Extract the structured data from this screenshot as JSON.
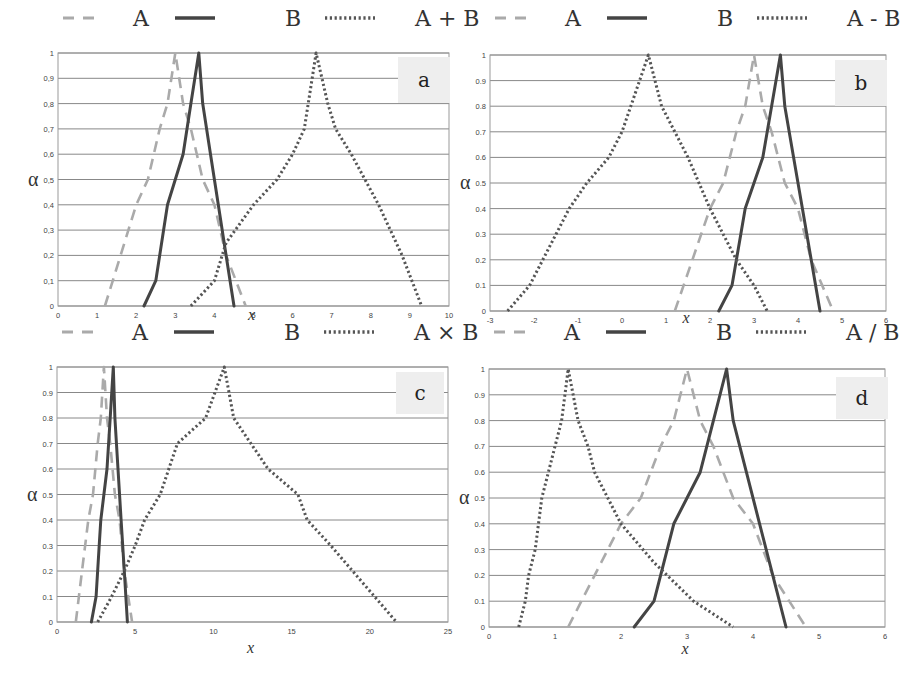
{
  "figure": {
    "legend_symbols": {
      "A": "dashed-grey",
      "B": "solid-dark",
      "op": "dotted-dark"
    }
  },
  "colors": {
    "A": "#aaaaaa",
    "B": "#444444",
    "op": "#555555",
    "grid": "#888888",
    "label_box": "#eeeeee"
  },
  "chart_data": [
    {
      "type": "line",
      "panel": "a",
      "title": "",
      "legend": [
        "A",
        "B",
        "A + B"
      ],
      "xlabel": "x",
      "ylabel": "α",
      "xlim": [
        0,
        10
      ],
      "ylim": [
        0,
        1
      ],
      "xticks": [
        "0",
        "1",
        "2",
        "3",
        "4",
        "5",
        "6",
        "7",
        "8",
        "9",
        "10"
      ],
      "yticks": [
        "0",
        "0,1",
        "0,2",
        "0,3",
        "0,4",
        "0,5",
        "0,6",
        "0,7",
        "0,8",
        "0,9",
        "1"
      ],
      "grid": "horizontal",
      "series": [
        {
          "name": "A",
          "x": [
            1.2,
            1.6,
            2.0,
            2.3,
            2.6,
            2.8,
            3.0,
            3.2,
            3.4,
            3.7,
            4.0,
            4.3,
            4.8
          ],
          "y": [
            0,
            0.2,
            0.4,
            0.5,
            0.7,
            0.8,
            1,
            0.8,
            0.7,
            0.5,
            0.4,
            0.2,
            0
          ]
        },
        {
          "name": "B",
          "x": [
            2.2,
            2.5,
            2.7,
            2.8,
            3.0,
            3.2,
            3.4,
            3.6,
            3.7,
            3.9,
            4.1,
            4.3,
            4.5
          ],
          "y": [
            0,
            0.1,
            0.3,
            0.4,
            0.5,
            0.6,
            0.8,
            1,
            0.8,
            0.6,
            0.4,
            0.2,
            0
          ]
        },
        {
          "name": "A + B",
          "x": [
            3.4,
            4.0,
            4.2,
            4.3,
            5.0,
            5.6,
            6.0,
            6.3,
            6.6,
            6.9,
            7.1,
            7.5,
            8.2,
            8.8,
            9.3
          ],
          "y": [
            0,
            0.1,
            0.2,
            0.25,
            0.4,
            0.5,
            0.6,
            0.7,
            1,
            0.8,
            0.7,
            0.6,
            0.4,
            0.2,
            0
          ]
        }
      ]
    },
    {
      "type": "line",
      "panel": "b",
      "title": "",
      "legend": [
        "A",
        "B",
        "A - B"
      ],
      "xlabel": "x",
      "ylabel": "α",
      "xlim": [
        -3,
        6
      ],
      "ylim": [
        0,
        1
      ],
      "xticks": [
        "-3",
        "-2",
        "-1",
        "0",
        "1",
        "2",
        "3",
        "4",
        "5",
        "6"
      ],
      "yticks": [
        "0",
        "0.1",
        "0.2",
        "0.3",
        "0.4",
        "0.5",
        "0.6",
        "0.7",
        "0.8",
        "0.9",
        "1"
      ],
      "grid": "horizontal",
      "series": [
        {
          "name": "A",
          "x": [
            1.2,
            1.6,
            2.0,
            2.3,
            2.6,
            2.8,
            3.0,
            3.2,
            3.4,
            3.7,
            4.0,
            4.3,
            4.8
          ],
          "y": [
            0,
            0.2,
            0.4,
            0.5,
            0.7,
            0.8,
            1,
            0.8,
            0.7,
            0.5,
            0.4,
            0.2,
            0
          ]
        },
        {
          "name": "B",
          "x": [
            2.2,
            2.5,
            2.7,
            2.8,
            3.0,
            3.2,
            3.4,
            3.6,
            3.7,
            3.9,
            4.1,
            4.3,
            4.5
          ],
          "y": [
            0,
            0.1,
            0.3,
            0.4,
            0.5,
            0.6,
            0.8,
            1,
            0.8,
            0.6,
            0.4,
            0.2,
            0
          ]
        },
        {
          "name": "A - B",
          "x": [
            -2.6,
            -2.1,
            -1.8,
            -1.5,
            -1.2,
            -0.8,
            -0.3,
            0.0,
            0.2,
            0.6,
            0.9,
            1.2,
            1.5,
            2.0,
            2.6,
            3.0,
            3.3
          ],
          "y": [
            0,
            0.1,
            0.2,
            0.3,
            0.4,
            0.5,
            0.6,
            0.7,
            0.8,
            1,
            0.8,
            0.7,
            0.6,
            0.4,
            0.2,
            0.1,
            0
          ]
        }
      ]
    },
    {
      "type": "line",
      "panel": "c",
      "title": "",
      "legend": [
        "A",
        "B",
        "A × B"
      ],
      "xlabel": "x",
      "ylabel": "α",
      "xlim": [
        0,
        25
      ],
      "ylim": [
        0,
        1
      ],
      "xticks": [
        "0",
        "5",
        "10",
        "15",
        "20",
        "25"
      ],
      "yticks": [
        "0",
        "0.1",
        "0.2",
        "0.3",
        "0.4",
        "0.5",
        "0.6",
        "0.7",
        "0.8",
        "0.9",
        "1"
      ],
      "grid": "horizontal",
      "series": [
        {
          "name": "A",
          "x": [
            1.2,
            1.6,
            2.0,
            2.3,
            2.6,
            2.8,
            3.0,
            3.2,
            3.4,
            3.7,
            4.0,
            4.3,
            4.8
          ],
          "y": [
            0,
            0.2,
            0.4,
            0.5,
            0.7,
            0.8,
            1,
            0.8,
            0.7,
            0.5,
            0.4,
            0.2,
            0
          ]
        },
        {
          "name": "B",
          "x": [
            2.2,
            2.5,
            2.7,
            2.8,
            3.0,
            3.2,
            3.4,
            3.6,
            3.7,
            3.9,
            4.1,
            4.3,
            4.5
          ],
          "y": [
            0,
            0.1,
            0.3,
            0.4,
            0.5,
            0.6,
            0.8,
            1,
            0.8,
            0.6,
            0.4,
            0.2,
            0
          ]
        },
        {
          "name": "A × B",
          "x": [
            2.6,
            3.5,
            4.3,
            5.0,
            5.6,
            6.6,
            7.7,
            9.5,
            10.7,
            11.3,
            12.4,
            13.5,
            15.4,
            16.0,
            17.5,
            18.9,
            20.3,
            21.7
          ],
          "y": [
            0,
            0.1,
            0.2,
            0.3,
            0.4,
            0.5,
            0.7,
            0.8,
            1,
            0.8,
            0.7,
            0.6,
            0.5,
            0.4,
            0.3,
            0.2,
            0.1,
            0
          ]
        }
      ]
    },
    {
      "type": "line",
      "panel": "d",
      "title": "",
      "legend": [
        "A",
        "B",
        "A / B"
      ],
      "xlabel": "x",
      "ylabel": "α",
      "xlim": [
        0,
        6
      ],
      "ylim": [
        0,
        1
      ],
      "xticks": [
        "0",
        "1",
        "2",
        "3",
        "4",
        "5",
        "6"
      ],
      "yticks": [
        "0",
        "0.1",
        "0.2",
        "0.3",
        "0.4",
        "0.5",
        "0.6",
        "0.7",
        "0.8",
        "0.9",
        "1"
      ],
      "grid": "horizontal",
      "series": [
        {
          "name": "A",
          "x": [
            1.2,
            1.6,
            2.0,
            2.3,
            2.6,
            2.8,
            3.0,
            3.2,
            3.4,
            3.7,
            4.0,
            4.3,
            4.8
          ],
          "y": [
            0,
            0.2,
            0.4,
            0.5,
            0.7,
            0.8,
            1,
            0.8,
            0.7,
            0.5,
            0.4,
            0.2,
            0
          ]
        },
        {
          "name": "B",
          "x": [
            2.2,
            2.5,
            2.7,
            2.8,
            3.0,
            3.2,
            3.4,
            3.6,
            3.7,
            3.9,
            4.1,
            4.3,
            4.5
          ],
          "y": [
            0,
            0.1,
            0.3,
            0.4,
            0.5,
            0.6,
            0.8,
            1,
            0.8,
            0.6,
            0.4,
            0.2,
            0
          ]
        },
        {
          "name": "A / B",
          "x": [
            0.45,
            0.55,
            0.6,
            0.7,
            0.75,
            0.8,
            0.9,
            1.0,
            1.1,
            1.2,
            1.35,
            1.5,
            1.6,
            1.8,
            2.0,
            2.5,
            2.7,
            3.1,
            3.7
          ],
          "y": [
            0,
            0.1,
            0.2,
            0.3,
            0.4,
            0.5,
            0.6,
            0.7,
            0.8,
            1,
            0.8,
            0.7,
            0.6,
            0.5,
            0.4,
            0.25,
            0.2,
            0.1,
            0
          ]
        }
      ]
    }
  ]
}
